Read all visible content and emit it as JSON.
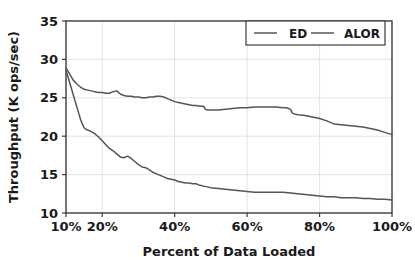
{
  "chart_data": {
    "type": "line",
    "title": "",
    "xlabel": "Percent of Data Loaded",
    "ylabel": "Throughput (K ops/sec)",
    "xlim": [
      10,
      100
    ],
    "ylim": [
      10,
      35
    ],
    "xticks": [
      10,
      20,
      40,
      60,
      80,
      100
    ],
    "xtick_labels": [
      "10%",
      "20%",
      "40%",
      "60%",
      "80%",
      "100%"
    ],
    "yticks": [
      10,
      15,
      20,
      25,
      30,
      35
    ],
    "ytick_labels": [
      "10",
      "15",
      "20",
      "25",
      "30",
      "35"
    ],
    "grid": true,
    "legend_position": "upper right",
    "series": [
      {
        "name": "ED",
        "color": "#555555",
        "x": [
          10,
          10.5,
          11,
          11.5,
          12,
          12.5,
          13,
          13.5,
          14,
          14.5,
          15,
          15.5,
          16,
          17,
          18,
          19,
          20,
          21,
          22,
          23,
          24,
          25,
          26,
          27,
          28,
          29,
          30,
          31,
          32,
          33,
          34,
          35,
          36,
          37,
          38,
          39,
          40,
          41,
          42,
          43,
          44,
          45,
          46,
          47,
          48,
          49,
          50,
          52,
          54,
          56,
          58,
          60,
          62,
          64,
          66,
          68,
          70,
          72,
          74,
          76,
          78,
          80,
          82,
          84,
          86,
          88,
          90,
          92,
          94,
          96,
          98,
          100
        ],
        "y": [
          28.6,
          27.8,
          27.0,
          26.2,
          25.4,
          24.6,
          23.8,
          23.0,
          22.2,
          21.6,
          21.1,
          20.9,
          20.8,
          20.6,
          20.3,
          19.9,
          19.4,
          18.9,
          18.4,
          18.1,
          17.7,
          17.3,
          17.2,
          17.4,
          17.1,
          16.7,
          16.3,
          16.0,
          15.9,
          15.6,
          15.3,
          15.1,
          14.9,
          14.7,
          14.5,
          14.4,
          14.3,
          14.1,
          14.0,
          13.9,
          13.9,
          13.8,
          13.8,
          13.6,
          13.5,
          13.4,
          13.3,
          13.2,
          13.1,
          13.0,
          12.9,
          12.8,
          12.7,
          12.7,
          12.7,
          12.7,
          12.7,
          12.6,
          12.5,
          12.4,
          12.3,
          12.2,
          12.1,
          12.1,
          12.0,
          12.0,
          12.0,
          11.9,
          11.9,
          11.8,
          11.8,
          11.7
        ]
      },
      {
        "name": "ALOR",
        "color": "#555555",
        "x": [
          10,
          10.5,
          11,
          11.5,
          12,
          13,
          14,
          15,
          16,
          17,
          18,
          19,
          20,
          21,
          22,
          23,
          24,
          25,
          26,
          27,
          28,
          29,
          30,
          31,
          32,
          33,
          34,
          35,
          36,
          37,
          38,
          39,
          40,
          41,
          42,
          43,
          44,
          45,
          46,
          47,
          48,
          48.5,
          49,
          50,
          52,
          54,
          56,
          58,
          60,
          62,
          64,
          66,
          68,
          70,
          71,
          72,
          72.5,
          73,
          74,
          76,
          78,
          80,
          82,
          83,
          84,
          86,
          88,
          90,
          92,
          94,
          96,
          98,
          100
        ],
        "y": [
          28.9,
          28.5,
          28.1,
          27.7,
          27.3,
          26.8,
          26.4,
          26.1,
          26.0,
          25.9,
          25.8,
          25.7,
          25.7,
          25.6,
          25.6,
          25.8,
          25.9,
          25.5,
          25.3,
          25.2,
          25.2,
          25.1,
          25.1,
          25.0,
          25.0,
          25.1,
          25.1,
          25.2,
          25.2,
          25.1,
          24.9,
          24.7,
          24.5,
          24.4,
          24.3,
          24.2,
          24.1,
          24.0,
          24.0,
          23.9,
          23.9,
          23.5,
          23.4,
          23.4,
          23.4,
          23.5,
          23.6,
          23.7,
          23.7,
          23.8,
          23.8,
          23.8,
          23.8,
          23.7,
          23.7,
          23.5,
          23.0,
          22.9,
          22.8,
          22.7,
          22.5,
          22.3,
          22.0,
          21.8,
          21.6,
          21.5,
          21.4,
          21.3,
          21.2,
          21.0,
          20.8,
          20.5,
          20.2
        ]
      }
    ]
  },
  "legend": {
    "entries": [
      {
        "label": "ED"
      },
      {
        "label": "ALOR"
      }
    ]
  }
}
